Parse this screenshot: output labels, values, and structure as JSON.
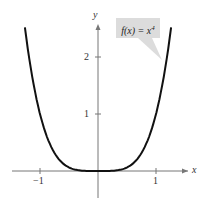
{
  "chart_data": {
    "type": "line",
    "title": "",
    "function": "f(x) = x^4",
    "annotation": "f(x) = x4",
    "xlabel": "x",
    "ylabel": "y",
    "xticks": [
      "-1",
      "1"
    ],
    "yticks": [
      "1",
      "2"
    ],
    "xlim": [
      -1.4,
      1.6
    ],
    "ylim": [
      -0.5,
      2.6
    ],
    "x": [
      -1.26,
      -1.0,
      -0.75,
      -0.5,
      -0.25,
      0,
      0.25,
      0.5,
      0.75,
      1.0,
      1.26
    ],
    "y": [
      2.52,
      1.0,
      0.32,
      0.06,
      0.004,
      0,
      0.004,
      0.06,
      0.32,
      1.0,
      2.52
    ],
    "grid": false
  },
  "labels": {
    "x": "x",
    "y": "y",
    "xneg1": "−1",
    "x1": "1",
    "y1": "1",
    "y2": "2",
    "f": "f(x) = x",
    "exp": "4"
  }
}
